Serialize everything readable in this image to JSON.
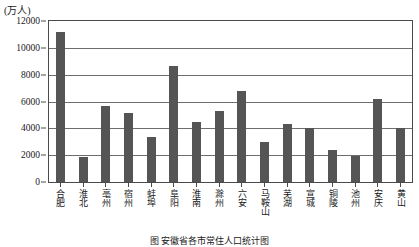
{
  "chart_data": {
    "type": "bar",
    "title": "",
    "unit_label": "(万人)",
    "xlabel": "",
    "ylabel": "",
    "ylim": [
      0,
      12000
    ],
    "ytick_values": [
      0,
      2000,
      4000,
      6000,
      8000,
      10000,
      12000
    ],
    "ytick_labels": [
      "0",
      "2000",
      "4000",
      "6000",
      "8000",
      "10000",
      "12000"
    ],
    "grid": true,
    "legend": "none",
    "bar_color": "#555555",
    "categories": [
      "合肥",
      "淮北",
      "亳州",
      "宿州",
      "蚌埠",
      "阜阳",
      "淮南",
      "滁州",
      "六安",
      "马鞍山",
      "芜湖",
      "宣城",
      "铜陵",
      "池州",
      "安庆",
      "黄山"
    ],
    "values": [
      11200,
      1850,
      5650,
      5150,
      3350,
      8650,
      4450,
      5300,
      6800,
      3000,
      4350,
      4050,
      2400,
      1950,
      6200,
      4050
    ]
  },
  "caption": {
    "text": "图  安徽省各市常住人口统计图"
  }
}
